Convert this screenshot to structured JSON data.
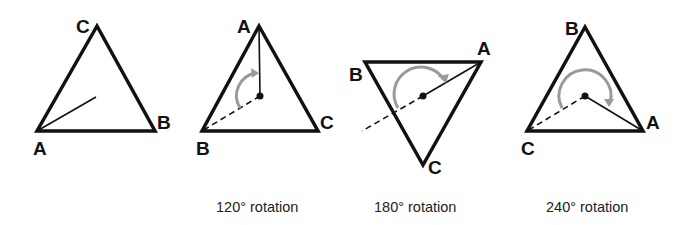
{
  "colors": {
    "stroke": "#111111",
    "arc": "#9a9a9a",
    "background": "#ffffff"
  },
  "panels": [
    {
      "id": "original",
      "caption": "",
      "vertices": {
        "top": "C",
        "left": "A",
        "right": "B"
      },
      "labels": {
        "v1": "C",
        "v2": "A",
        "v3": "B"
      }
    },
    {
      "id": "rot120",
      "caption": "120° rotation",
      "labels": {
        "v1": "A",
        "v2": "B",
        "v3": "C"
      }
    },
    {
      "id": "rot180",
      "caption": "180° rotation",
      "labels": {
        "v1": "B",
        "v2": "A",
        "v3": "C"
      }
    },
    {
      "id": "rot240",
      "caption": "240° rotation",
      "labels": {
        "v1": "B",
        "v2": "C",
        "v3": "A"
      }
    }
  ]
}
